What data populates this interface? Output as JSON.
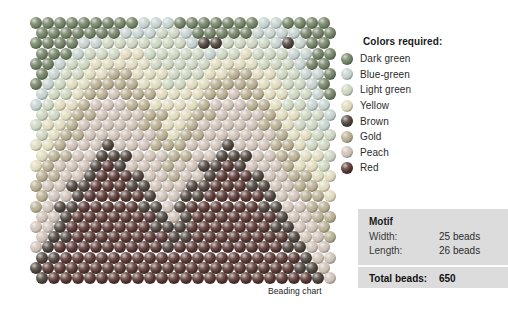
{
  "caption": "Beading chart",
  "legend": {
    "title": "Colors required:",
    "items": [
      {
        "label": "Dark green",
        "color": "#6f7f62",
        "key": "dark-green"
      },
      {
        "label": "Blue-green",
        "color": "#c3d0cb",
        "key": "blue-green"
      },
      {
        "label": "Light green",
        "color": "#cbd3bd",
        "key": "light-green"
      },
      {
        "label": "Yellow",
        "color": "#ded9bb",
        "key": "yellow"
      },
      {
        "label": "Brown",
        "color": "#4a4038",
        "key": "brown"
      },
      {
        "label": "Gold",
        "color": "#b5ab8e",
        "key": "gold"
      },
      {
        "label": "Peach",
        "color": "#cdbfb4",
        "key": "peach"
      },
      {
        "label": "Red",
        "color": "#54332f",
        "key": "red"
      }
    ]
  },
  "motif": {
    "heading": "Motif",
    "width_label": "Width:",
    "width_value": "25 beads",
    "length_label": "Length:",
    "length_value": "26 beads",
    "total_label": "Total beads:",
    "total_value": "650"
  },
  "chart_data": {
    "type": "heatmap",
    "title": "Beading chart",
    "xlabel": "",
    "ylabel": "",
    "columns": 25,
    "rows": 26,
    "total_beads": 650,
    "stitch": "brick",
    "palette": {
      "dark-green": "#6f7f62",
      "blue-green": "#c3d0cb",
      "light-green": "#cbd3bd",
      "yellow": "#ded9bb",
      "brown": "#4a4038",
      "gold": "#b5ab8e",
      "peach": "#cdbfb4",
      "red": "#54332f"
    },
    "legend_order": [
      "dark-green",
      "blue-green",
      "light-green",
      "yellow",
      "brown",
      "gold",
      "peach",
      "red"
    ],
    "row_offsets": [
      0,
      1,
      0,
      1,
      0,
      1,
      0,
      1,
      0,
      1,
      0,
      1,
      0,
      1,
      0,
      1,
      0,
      1,
      0,
      1,
      0,
      1,
      0,
      1,
      0,
      1
    ],
    "grid": [
      [
        "dark-green",
        "dark-green",
        "dark-green",
        "dark-green",
        "dark-green",
        "dark-green",
        "dark-green",
        "dark-green",
        "dark-green",
        "blue-green",
        "blue-green",
        "blue-green",
        "dark-green",
        "dark-green",
        "dark-green",
        "dark-green",
        "dark-green",
        "dark-green",
        "dark-green",
        "blue-green",
        "blue-green",
        "dark-green",
        "dark-green",
        "dark-green",
        "dark-green"
      ],
      [
        "dark-green",
        "dark-green",
        "dark-green",
        "dark-green",
        "dark-green",
        "dark-green",
        "dark-green",
        "blue-green",
        "blue-green",
        "blue-green",
        "light-green",
        "light-green",
        "blue-green",
        "dark-green",
        "dark-green",
        "dark-green",
        "dark-green",
        "dark-green",
        "blue-green",
        "blue-green",
        "blue-green",
        "blue-green",
        "dark-green",
        "dark-green",
        "dark-green"
      ],
      [
        "dark-green",
        "dark-green",
        "dark-green",
        "dark-green",
        "blue-green",
        "blue-green",
        "light-green",
        "light-green",
        "light-green",
        "light-green",
        "light-green",
        "light-green",
        "light-green",
        "blue-green",
        "brown",
        "brown",
        "light-green",
        "light-green",
        "light-green",
        "light-green",
        "blue-green",
        "brown",
        "blue-green",
        "dark-green",
        "dark-green"
      ],
      [
        "dark-green",
        "dark-green",
        "dark-green",
        "blue-green",
        "light-green",
        "light-green",
        "light-green",
        "yellow",
        "yellow",
        "light-green",
        "light-green",
        "light-green",
        "light-green",
        "light-green",
        "blue-green",
        "light-green",
        "light-green",
        "yellow",
        "light-green",
        "light-green",
        "light-green",
        "blue-green",
        "blue-green",
        "dark-green",
        "dark-green"
      ],
      [
        "dark-green",
        "dark-green",
        "blue-green",
        "light-green",
        "light-green",
        "yellow",
        "yellow",
        "yellow",
        "yellow",
        "yellow",
        "light-green",
        "light-green",
        "light-green",
        "light-green",
        "light-green",
        "yellow",
        "yellow",
        "yellow",
        "yellow",
        "light-green",
        "light-green",
        "light-green",
        "blue-green",
        "dark-green",
        "dark-green"
      ],
      [
        "dark-green",
        "blue-green",
        "light-green",
        "light-green",
        "yellow",
        "yellow",
        "gold",
        "gold",
        "yellow",
        "yellow",
        "yellow",
        "light-green",
        "light-green",
        "light-green",
        "yellow",
        "yellow",
        "gold",
        "gold",
        "yellow",
        "yellow",
        "light-green",
        "light-green",
        "blue-green",
        "blue-green",
        "dark-green"
      ],
      [
        "dark-green",
        "blue-green",
        "light-green",
        "yellow",
        "yellow",
        "gold",
        "gold",
        "gold",
        "gold",
        "yellow",
        "yellow",
        "light-green",
        "light-green",
        "yellow",
        "yellow",
        "gold",
        "gold",
        "gold",
        "gold",
        "yellow",
        "yellow",
        "light-green",
        "light-green",
        "blue-green",
        "dark-green"
      ],
      [
        "blue-green",
        "light-green",
        "light-green",
        "yellow",
        "gold",
        "gold",
        "peach",
        "gold",
        "gold",
        "gold",
        "yellow",
        "yellow",
        "yellow",
        "yellow",
        "gold",
        "gold",
        "peach",
        "gold",
        "gold",
        "yellow",
        "yellow",
        "light-green",
        "light-green",
        "blue-green",
        "dark-green"
      ],
      [
        "blue-green",
        "light-green",
        "yellow",
        "yellow",
        "gold",
        "peach",
        "peach",
        "peach",
        "gold",
        "gold",
        "yellow",
        "yellow",
        "yellow",
        "yellow",
        "gold",
        "peach",
        "peach",
        "peach",
        "gold",
        "gold",
        "yellow",
        "light-green",
        "light-green",
        "blue-green",
        "blue-green"
      ],
      [
        "light-green",
        "light-green",
        "yellow",
        "gold",
        "gold",
        "peach",
        "peach",
        "peach",
        "peach",
        "gold",
        "gold",
        "yellow",
        "yellow",
        "gold",
        "gold",
        "peach",
        "peach",
        "peach",
        "peach",
        "gold",
        "yellow",
        "yellow",
        "light-green",
        "light-green",
        "blue-green"
      ],
      [
        "light-green",
        "yellow",
        "yellow",
        "gold",
        "peach",
        "peach",
        "peach",
        "peach",
        "peach",
        "gold",
        "gold",
        "yellow",
        "yellow",
        "gold",
        "peach",
        "peach",
        "peach",
        "peach",
        "peach",
        "gold",
        "gold",
        "yellow",
        "light-green",
        "light-green",
        "blue-green"
      ],
      [
        "light-green",
        "yellow",
        "gold",
        "gold",
        "peach",
        "peach",
        "peach",
        "peach",
        "peach",
        "peach",
        "gold",
        "yellow",
        "gold",
        "gold",
        "peach",
        "peach",
        "peach",
        "peach",
        "peach",
        "peach",
        "gold",
        "yellow",
        "yellow",
        "light-green",
        "light-green"
      ],
      [
        "yellow",
        "yellow",
        "gold",
        "peach",
        "peach",
        "peach",
        "brown",
        "peach",
        "peach",
        "peach",
        "gold",
        "gold",
        "gold",
        "peach",
        "peach",
        "peach",
        "brown",
        "peach",
        "peach",
        "peach",
        "gold",
        "gold",
        "yellow",
        "light-green",
        "light-green"
      ],
      [
        "yellow",
        "gold",
        "gold",
        "peach",
        "peach",
        "brown",
        "brown",
        "brown",
        "peach",
        "peach",
        "peach",
        "gold",
        "gold",
        "peach",
        "peach",
        "brown",
        "brown",
        "brown",
        "peach",
        "peach",
        "gold",
        "gold",
        "yellow",
        "yellow",
        "light-green"
      ],
      [
        "yellow",
        "gold",
        "peach",
        "peach",
        "peach",
        "brown",
        "red",
        "brown",
        "peach",
        "peach",
        "peach",
        "gold",
        "peach",
        "peach",
        "brown",
        "brown",
        "red",
        "brown",
        "peach",
        "peach",
        "peach",
        "gold",
        "yellow",
        "yellow",
        "light-green"
      ],
      [
        "gold",
        "gold",
        "peach",
        "peach",
        "brown",
        "red",
        "red",
        "red",
        "brown",
        "peach",
        "peach",
        "gold",
        "peach",
        "peach",
        "brown",
        "red",
        "red",
        "red",
        "brown",
        "peach",
        "peach",
        "gold",
        "gold",
        "yellow",
        "yellow"
      ],
      [
        "gold",
        "peach",
        "peach",
        "brown",
        "brown",
        "red",
        "red",
        "red",
        "brown",
        "brown",
        "peach",
        "peach",
        "peach",
        "brown",
        "brown",
        "red",
        "red",
        "red",
        "brown",
        "brown",
        "peach",
        "peach",
        "gold",
        "gold",
        "yellow"
      ],
      [
        "gold",
        "peach",
        "peach",
        "brown",
        "red",
        "red",
        "red",
        "red",
        "red",
        "brown",
        "peach",
        "peach",
        "brown",
        "brown",
        "red",
        "red",
        "red",
        "red",
        "red",
        "brown",
        "peach",
        "peach",
        "gold",
        "gold",
        "yellow"
      ],
      [
        "gold",
        "peach",
        "brown",
        "brown",
        "red",
        "red",
        "red",
        "red",
        "red",
        "brown",
        "brown",
        "peach",
        "brown",
        "red",
        "red",
        "red",
        "red",
        "red",
        "red",
        "brown",
        "brown",
        "peach",
        "peach",
        "gold",
        "gold"
      ],
      [
        "peach",
        "peach",
        "brown",
        "red",
        "red",
        "red",
        "red",
        "red",
        "red",
        "red",
        "brown",
        "peach",
        "brown",
        "red",
        "red",
        "red",
        "red",
        "red",
        "red",
        "red",
        "brown",
        "peach",
        "peach",
        "gold",
        "gold"
      ],
      [
        "peach",
        "peach",
        "brown",
        "red",
        "red",
        "red",
        "red",
        "red",
        "red",
        "red",
        "brown",
        "brown",
        "brown",
        "red",
        "red",
        "red",
        "red",
        "red",
        "red",
        "red",
        "brown",
        "brown",
        "peach",
        "peach",
        "gold"
      ],
      [
        "peach",
        "brown",
        "brown",
        "red",
        "red",
        "red",
        "red",
        "red",
        "red",
        "red",
        "red",
        "brown",
        "brown",
        "red",
        "red",
        "red",
        "red",
        "red",
        "red",
        "red",
        "red",
        "brown",
        "peach",
        "peach",
        "gold"
      ],
      [
        "peach",
        "brown",
        "red",
        "red",
        "red",
        "red",
        "red",
        "red",
        "red",
        "red",
        "red",
        "brown",
        "red",
        "red",
        "red",
        "red",
        "red",
        "red",
        "red",
        "red",
        "red",
        "brown",
        "brown",
        "peach",
        "peach"
      ],
      [
        "brown",
        "brown",
        "red",
        "red",
        "red",
        "red",
        "red",
        "red",
        "red",
        "red",
        "red",
        "red",
        "red",
        "red",
        "red",
        "red",
        "red",
        "red",
        "red",
        "red",
        "red",
        "red",
        "brown",
        "peach",
        "peach"
      ],
      [
        "brown",
        "red",
        "red",
        "red",
        "red",
        "red",
        "red",
        "red",
        "red",
        "red",
        "red",
        "red",
        "red",
        "red",
        "red",
        "red",
        "red",
        "red",
        "red",
        "red",
        "red",
        "red",
        "brown",
        "brown",
        "peach"
      ],
      [
        "brown",
        "red",
        "red",
        "red",
        "red",
        "red",
        "red",
        "red",
        "red",
        "red",
        "red",
        "red",
        "red",
        "red",
        "red",
        "red",
        "red",
        "red",
        "red",
        "red",
        "red",
        "red",
        "red",
        "brown",
        "peach"
      ]
    ]
  }
}
